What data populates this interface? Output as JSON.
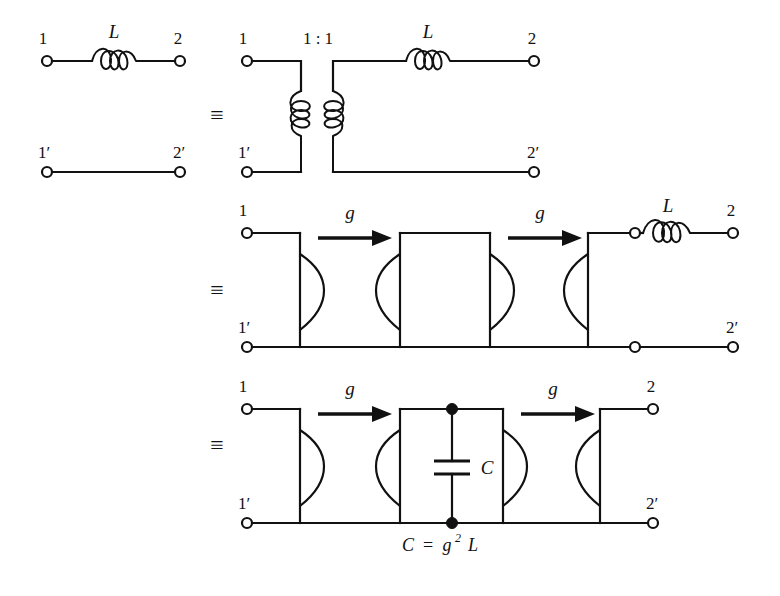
{
  "figure": {
    "background_color": "#ffffff",
    "line_color": "#111111"
  },
  "symbols": {
    "equivalence": "≡",
    "inductor_label": "L",
    "capacitor_label": "C",
    "gyration_label": "g",
    "transformer_ratio": "1 : 1"
  },
  "terminal_labels": {
    "in_top": "1",
    "in_bottom": "1′",
    "out_top": "2",
    "out_bottom": "2′"
  },
  "caption": {
    "lhs": "C",
    "equals": "=",
    "rhs_base": "g",
    "rhs_exponent": "2",
    "rhs_factor": "L",
    "full": "C = g² L"
  },
  "rows": [
    {
      "id": "row-1",
      "name": "series-inductor-equals-transformer-coupled-inductor",
      "equivalence": "≡",
      "left_circuit": {
        "name": "series-inductor-two-port",
        "elements": [
          "terminal-1",
          "inductor-L",
          "terminal-2",
          "terminal-1-prime",
          "terminal-2-prime"
        ],
        "inductor_label": "L"
      },
      "right_circuit": {
        "name": "ideal-transformer-with-series-inductor",
        "transformer_ratio": "1 : 1",
        "inductor_label": "L"
      }
    },
    {
      "id": "row-2",
      "name": "three-gyrator-cascade-with-load-inductor",
      "equivalence": "≡",
      "gyrators": [
        {
          "name": "gyrator-1",
          "label": "g"
        },
        {
          "name": "gyrator-2",
          "label": "g"
        },
        {
          "name": "gyrator-3",
          "label": "g"
        }
      ],
      "arrow_labels": [
        "g",
        "g"
      ],
      "load_label": "L"
    },
    {
      "id": "row-3",
      "name": "two-gyrator-cascade-with-shunt-capacitor",
      "equivalence": "≡",
      "gyrators": [
        {
          "name": "gyrator-1",
          "label": "g"
        },
        {
          "name": "gyrator-2",
          "label": "g"
        },
        {
          "name": "gyrator-3",
          "label": "g"
        }
      ],
      "arrow_labels": [
        "g",
        "g"
      ],
      "shunt_element_label": "C",
      "caption": "C = g² L"
    }
  ]
}
